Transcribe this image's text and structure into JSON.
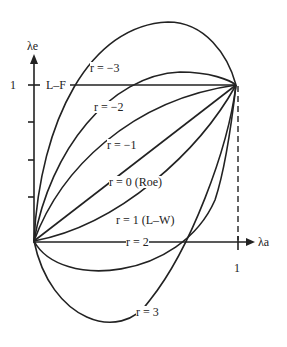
{
  "axes": {
    "y_label": "λe",
    "x_label": "λa",
    "y_tick_one": "1",
    "x_tick_one": "1"
  },
  "lines": {
    "lf": "L–F"
  },
  "curves": [
    {
      "label": "r = −3"
    },
    {
      "label": "r = −2"
    },
    {
      "label": "r = −1"
    },
    {
      "label": "r = 0 (Roe)"
    },
    {
      "label": "r = 1 (L–W)"
    },
    {
      "label": "r = 2"
    },
    {
      "label": "r = 3"
    }
  ],
  "colors": {
    "ink": "#222222",
    "background": "#ffffff"
  }
}
